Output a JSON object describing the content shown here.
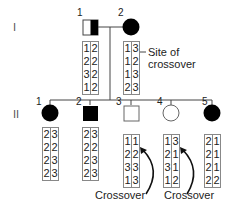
{
  "generations": [
    {
      "label": "I"
    },
    {
      "label": "II"
    }
  ],
  "gen1": {
    "individuals": [
      {
        "number": "1",
        "sex": "male",
        "affected": "half",
        "haplotypes": {
          "left": [
            "1",
            "2",
            "3",
            "1"
          ],
          "right": [
            "2",
            "2",
            "2",
            "2"
          ]
        }
      },
      {
        "number": "2",
        "sex": "female",
        "affected": "full",
        "haplotypes": {
          "left": [
            "1",
            "1",
            "1",
            "2"
          ],
          "right": [
            "3",
            "2",
            "3",
            "3"
          ]
        }
      }
    ],
    "annotation": {
      "line1": "Site of",
      "line2": "crossover"
    }
  },
  "gen2": {
    "individuals": [
      {
        "number": "1",
        "sex": "female",
        "affected": "full",
        "haplotypes": {
          "left": [
            "2",
            "2",
            "2",
            "2"
          ],
          "right": [
            "3",
            "2",
            "3",
            "3"
          ]
        }
      },
      {
        "number": "2",
        "sex": "male",
        "affected": "full",
        "haplotypes": {
          "left": [
            "2",
            "2",
            "2",
            "2"
          ],
          "right": [
            "3",
            "2",
            "3",
            "3"
          ]
        }
      },
      {
        "number": "3",
        "sex": "male",
        "affected": "none",
        "haplotypes": {
          "left": [
            "1",
            "2",
            "3",
            "1"
          ],
          "right": [
            "1",
            "2",
            "3",
            "3"
          ]
        }
      },
      {
        "number": "4",
        "sex": "female",
        "affected": "none",
        "haplotypes": {
          "left": [
            "1",
            "2",
            "3",
            "1"
          ],
          "right": [
            "3",
            "1",
            "1",
            "2"
          ]
        }
      },
      {
        "number": "5",
        "sex": "female",
        "affected": "full",
        "haplotypes": {
          "left": [
            "2",
            "2",
            "2",
            "2"
          ],
          "right": [
            "1",
            "1",
            "1",
            "2"
          ]
        }
      }
    ],
    "crossover_labels": [
      "Crossover",
      "Crossover"
    ]
  },
  "colors": {
    "line": "#444444",
    "affected": "#000000",
    "box_border": "#888888"
  }
}
